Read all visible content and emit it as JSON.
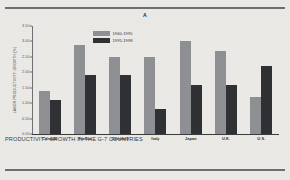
{
  "figure": {
    "panel_label": "A",
    "caption": "PRODUCTIVITY GROWTH IN THE G-7 COUNTRIES"
  },
  "colors": {
    "series_1": "#8e9093",
    "series_2": "#2f3033",
    "axis": "#3a3a3a",
    "paper": "#eceae7",
    "rule": "#6d6e70"
  },
  "chart_data": {
    "type": "bar",
    "title": "A",
    "xlabel": "",
    "ylabel": "LABOR PRODUCTIVITY GROWTH (%)",
    "ylim": [
      0,
      3.5
    ],
    "yticks": [
      "0.00",
      "0.50",
      "1.00",
      "1.50",
      "2.00",
      "2.50",
      "3.00",
      "3.50"
    ],
    "ytick_values": [
      0,
      0.5,
      1.0,
      1.5,
      2.0,
      2.5,
      3.0,
      3.5
    ],
    "grid": false,
    "legend_position": "top-center",
    "categories": [
      "Canada",
      "France",
      "Germany",
      "Italy",
      "Japan",
      "U.K.",
      "U.S."
    ],
    "series": [
      {
        "name": "1960-1995",
        "color": "#8e9093",
        "values": [
          1.4,
          2.9,
          2.5,
          2.5,
          3.0,
          2.7,
          1.2
        ]
      },
      {
        "name": "1995-1998",
        "color": "#2f3033",
        "values": [
          1.1,
          1.9,
          1.9,
          0.8,
          1.6,
          1.6,
          2.2
        ]
      }
    ]
  }
}
